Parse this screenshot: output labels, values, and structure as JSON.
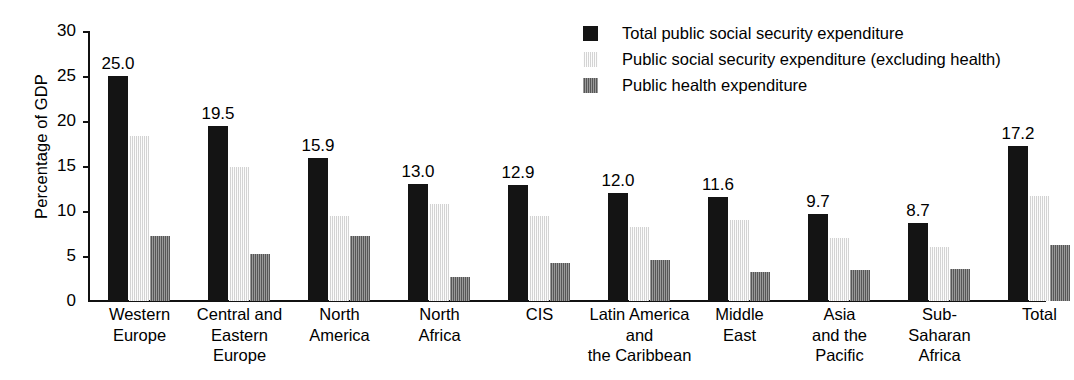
{
  "chart_data": {
    "type": "bar",
    "title": "",
    "xlabel": "",
    "ylabel": "Percentage of GDP",
    "ylim": [
      0,
      30
    ],
    "yticks": [
      0,
      5,
      10,
      15,
      20,
      25,
      30
    ],
    "ytick_labels": [
      "0",
      "5",
      "10",
      "15",
      "20",
      "25",
      "30"
    ],
    "grid": false,
    "legend_position": "top-right",
    "categories": [
      "Western\nEurope",
      "Central and\nEastern\nEurope",
      "North\nAmerica",
      "North\nAfrica",
      "CIS",
      "Latin America\nand\nthe Caribbean",
      "Middle\nEast",
      "Asia\nand the\nPacific",
      "Sub-\nSaharan\nAfrica",
      "Total"
    ],
    "series": [
      {
        "name": "Total public social security expenditure",
        "color": "#141414",
        "values": [
          25.0,
          19.5,
          15.9,
          13.0,
          12.9,
          12.0,
          11.6,
          9.7,
          8.7,
          17.2
        ]
      },
      {
        "name": "Public social security expenditure (excluding health)",
        "color": "#e2e2e2",
        "values": [
          18.3,
          14.9,
          9.4,
          10.8,
          9.5,
          8.2,
          9.0,
          7.0,
          6.0,
          11.7
        ]
      },
      {
        "name": "Public health expenditure",
        "color": "#6f6f6f",
        "values": [
          7.2,
          5.2,
          7.2,
          2.7,
          4.2,
          4.6,
          3.2,
          3.4,
          3.6,
          6.2
        ]
      }
    ],
    "data_labels": [
      "25.0",
      "19.5",
      "15.9",
      "13.0",
      "12.9",
      "12.0",
      "11.6",
      "9.7",
      "8.7",
      "17.2"
    ]
  },
  "legend": {
    "items": [
      {
        "label": "Total public social security expenditure",
        "swatch": "black-swatch"
      },
      {
        "label": "Public social security expenditure (excluding health)",
        "swatch": "light-gray-swatch"
      },
      {
        "label": "Public health expenditure",
        "swatch": "dark-gray-swatch"
      }
    ]
  }
}
